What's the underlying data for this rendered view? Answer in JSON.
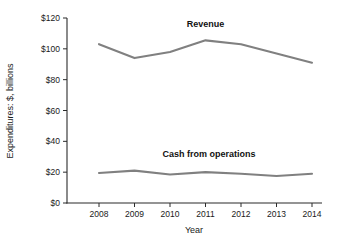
{
  "chart_data": {
    "type": "line",
    "title": "",
    "xlabel": "Year",
    "ylabel": "Expenditures: $, billions",
    "categories": [
      "2008",
      "2009",
      "2010",
      "2011",
      "2012",
      "2013",
      "2014"
    ],
    "x": [
      2008,
      2009,
      2010,
      2011,
      2012,
      2013,
      2014
    ],
    "xlim": [
      2008,
      2014
    ],
    "ylim": [
      0,
      120
    ],
    "ytick_labels": [
      "$0",
      "$20",
      "$40",
      "$60",
      "$80",
      "$100",
      "$120"
    ],
    "ytick_values": [
      0,
      20,
      40,
      60,
      80,
      100,
      120
    ],
    "grid": false,
    "legend_position": "inline-annotations",
    "series": [
      {
        "name": "Revenue",
        "label": "Revenue",
        "color": "#808080",
        "values": [
          103,
          94,
          98,
          105.5,
          103,
          97,
          91
        ]
      },
      {
        "name": "Cash from operations",
        "label": "Cash from operations",
        "color": "#808080",
        "values": [
          19.5,
          21,
          18.5,
          20,
          19,
          17.5,
          19
        ]
      }
    ],
    "annotations": [
      {
        "text": "Revenue",
        "x": 2011,
        "y": 114
      },
      {
        "text": "Cash from operations",
        "x": 2011.1,
        "y": 30
      }
    ]
  }
}
